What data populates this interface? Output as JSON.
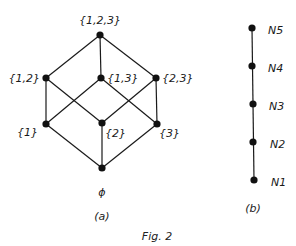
{
  "figure": {
    "caption": "Fig. 2",
    "panel_a": {
      "label": "(a)",
      "nodes": {
        "top": "{1,2,3}",
        "n12": "{1,2}",
        "n13": "{1,3}",
        "n23": "{2,3}",
        "n1": "{1}",
        "n2": "{2}",
        "n3": "{3}",
        "bottom": "ϕ"
      }
    },
    "panel_b": {
      "label": "(b)",
      "nodes": [
        "N1",
        "N2",
        "N3",
        "N4",
        "N5"
      ]
    }
  }
}
